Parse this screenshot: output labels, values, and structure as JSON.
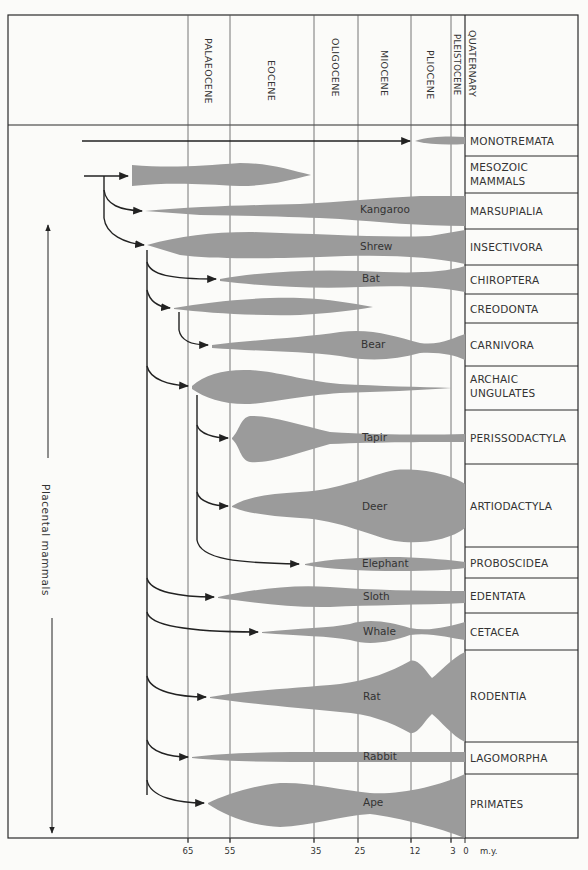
{
  "header": {
    "epochs": [
      {
        "name": "PALAEOCENE",
        "start_my": 65,
        "end_my": 55
      },
      {
        "name": "EOCENE",
        "start_my": 55,
        "end_my": 35
      },
      {
        "name": "OLIGOCENE",
        "start_my": 35,
        "end_my": 25
      },
      {
        "name": "MIOCENE",
        "start_my": 25,
        "end_my": 12
      },
      {
        "name": "PLIOCENE",
        "start_my": 12,
        "end_my": 3
      },
      {
        "name": "PLEISTOCENE",
        "start_my": 3,
        "end_my": 0
      },
      {
        "name": "QUATERNARY",
        "start_my": 3,
        "end_my": 0
      }
    ]
  },
  "axis": {
    "ticks": [
      "65",
      "55",
      "35",
      "25",
      "12",
      "3",
      "0"
    ],
    "unit": "m.y."
  },
  "side_label": "Placental   mammals",
  "orders": [
    {
      "name": "MONOTREMATA",
      "genus": ""
    },
    {
      "name": "MESOZOIC MAMMALS",
      "line1": "MESOZOIC",
      "line2": "MAMMALS",
      "genus": ""
    },
    {
      "name": "MARSUPIALIA",
      "genus": "Kangaroo"
    },
    {
      "name": "INSECTIVORA",
      "genus": "Shrew"
    },
    {
      "name": "CHIROPTERA",
      "genus": "Bat"
    },
    {
      "name": "CREODONTA",
      "genus": ""
    },
    {
      "name": "CARNIVORA",
      "genus": "Bear"
    },
    {
      "name": "ARCHAIC UNGULATES",
      "line1": "ARCHAIC",
      "line2": "UNGULATES",
      "genus": ""
    },
    {
      "name": "PERISSODACTYLA",
      "genus": "Tapir"
    },
    {
      "name": "ARTIODACTYLA",
      "genus": "Deer"
    },
    {
      "name": "PROBOSCIDEA",
      "genus": "Elephant"
    },
    {
      "name": "EDENTATA",
      "genus": "Sloth"
    },
    {
      "name": "CETACEA",
      "genus": "Whale"
    },
    {
      "name": "RODENTIA",
      "genus": "Rat"
    },
    {
      "name": "LAGOMORPHA",
      "genus": "Rabbit"
    },
    {
      "name": "PRIMATES",
      "genus": "Ape"
    }
  ],
  "colors": {
    "spindle": "#9b9b9b",
    "line": "#2a2a2a",
    "grid": "#555555",
    "background": "#fbfbf9"
  }
}
